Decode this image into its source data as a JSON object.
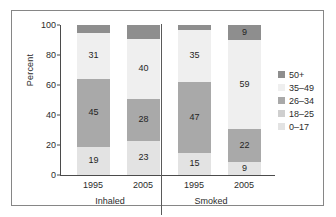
{
  "chart_data": {
    "type": "bar",
    "subtype": "stacked-bar-100",
    "title": "",
    "xlabel": "",
    "ylabel": "Percent",
    "ylim": [
      0,
      100
    ],
    "yticks": [
      0,
      20,
      40,
      60,
      80,
      100
    ],
    "grid": false,
    "legend_position": "right",
    "categories": [
      "1995",
      "2005",
      "1995",
      "2005"
    ],
    "groups": [
      {
        "label": "Inhaled",
        "categories": [
          "1995",
          "2005"
        ]
      },
      {
        "label": "Smoked",
        "categories": [
          "1995",
          "2005"
        ]
      }
    ],
    "series": [
      {
        "name": "0–17",
        "color": "#e3e3e3",
        "values": [
          19,
          23,
          15,
          9
        ]
      },
      {
        "name": "18–25",
        "color": "#cfcfcf",
        "values": [
          3,
          6,
          2,
          1
        ]
      },
      {
        "name": "26–34",
        "color": "#a9a9a9",
        "values": [
          45,
          28,
          47,
          22
        ]
      },
      {
        "name": "35–49",
        "color": "#efefef",
        "values": [
          31,
          40,
          35,
          59
        ]
      },
      {
        "name": "50+",
        "color": "#8e8e8e",
        "values": [
          2,
          3,
          1,
          9
        ]
      }
    ],
    "bars": [
      {
        "group": "Inhaled",
        "year": "1995",
        "segments": [
          {
            "series": "0–17",
            "value": 19,
            "label": "19",
            "show_label": true
          },
          {
            "series": "26–34",
            "value": 45,
            "label": "45",
            "show_label": true
          },
          {
            "series": "35–49",
            "value": 31,
            "label": "31",
            "show_label": true
          },
          {
            "series": "50+",
            "value": 5,
            "label": "",
            "show_label": false
          }
        ]
      },
      {
        "group": "Inhaled",
        "year": "2005",
        "segments": [
          {
            "series": "0–17",
            "value": 23,
            "label": "23",
            "show_label": true
          },
          {
            "series": "26–34",
            "value": 28,
            "label": "28",
            "show_label": true
          },
          {
            "series": "35–49",
            "value": 40,
            "label": "40",
            "show_label": true
          },
          {
            "series": "50+",
            "value": 9,
            "label": "",
            "show_label": false
          }
        ]
      },
      {
        "group": "Smoked",
        "year": "1995",
        "segments": [
          {
            "series": "0–17",
            "value": 15,
            "label": "15",
            "show_label": true
          },
          {
            "series": "26–34",
            "value": 47,
            "label": "47",
            "show_label": true
          },
          {
            "series": "35–49",
            "value": 35,
            "label": "35",
            "show_label": true
          },
          {
            "series": "50+",
            "value": 3,
            "label": "",
            "show_label": false
          }
        ]
      },
      {
        "group": "Smoked",
        "year": "2005",
        "segments": [
          {
            "series": "0–17",
            "value": 9,
            "label": "9",
            "show_label": true
          },
          {
            "series": "26–34",
            "value": 22,
            "label": "22",
            "show_label": true
          },
          {
            "series": "35–49",
            "value": 59,
            "label": "59",
            "show_label": true
          },
          {
            "series": "50+",
            "value": 10,
            "label": "9",
            "show_label": true
          }
        ]
      }
    ],
    "legend": [
      {
        "label": "50+",
        "color": "#8e8e8e"
      },
      {
        "label": "35–49",
        "color": "#efefef"
      },
      {
        "label": "26–34",
        "color": "#a9a9a9"
      },
      {
        "label": "18–25",
        "color": "#cfcfcf"
      },
      {
        "label": "0–17",
        "color": "#e3e3e3"
      }
    ]
  },
  "axis": {
    "y_label": "Percent",
    "y_ticks": [
      "100",
      "80",
      "60",
      "40",
      "20",
      "0"
    ]
  },
  "colors": {
    "frame": "#868686",
    "axis": "#4b4b4b",
    "text": "#2b2b2b",
    "divider": "#5a5a5a"
  }
}
